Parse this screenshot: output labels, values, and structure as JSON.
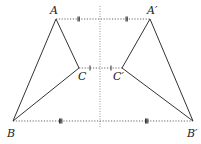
{
  "diagram": {
    "points": {
      "A": {
        "label": "A",
        "x": 56,
        "y": 19
      },
      "A2": {
        "label": "A′",
        "x": 150,
        "y": 19
      },
      "B": {
        "label": "B",
        "x": 13,
        "y": 121
      },
      "B2": {
        "label": "B′",
        "x": 193,
        "y": 121
      },
      "C": {
        "label": "C",
        "x": 79,
        "y": 68
      },
      "C2": {
        "label": "C′",
        "x": 122,
        "y": 68
      }
    },
    "labels": {
      "A": "A",
      "A_prime": "A′",
      "B": "B",
      "B_prime": "B′",
      "C": "C",
      "C_prime": "C′"
    },
    "axis": {
      "x": 100,
      "y1": 6,
      "y2": 128,
      "style": "dotted"
    },
    "tick_marks": {
      "AA_prime": "double",
      "CC_prime": "single",
      "BB_prime": "triple-bar"
    },
    "colors": {
      "line": "#333333",
      "dotted": "#555555",
      "text": "#222222"
    }
  }
}
